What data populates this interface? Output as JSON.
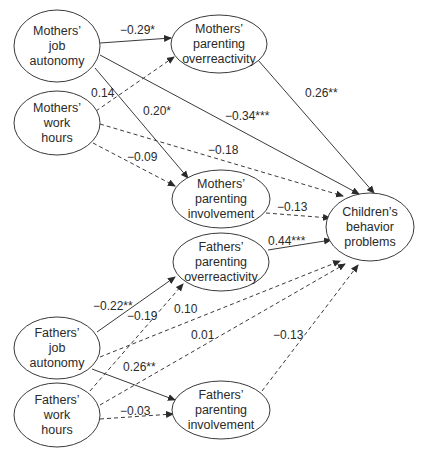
{
  "diagram": {
    "title": "",
    "line_color": "#3a3a3a",
    "text_color": "#2a2a2a",
    "nodes": [
      {
        "id": "mja",
        "lines": [
          "Mothers’",
          "job",
          "autonomy"
        ],
        "cx": 57,
        "cy": 46,
        "rx": 43,
        "ry": 36
      },
      {
        "id": "mwh",
        "lines": [
          "Mothers’",
          "work",
          "hours"
        ],
        "cx": 57,
        "cy": 123,
        "rx": 43,
        "ry": 32
      },
      {
        "id": "mpo",
        "lines": [
          "Mothers’",
          "parenting",
          "overreactivity"
        ],
        "cx": 219,
        "cy": 44,
        "rx": 48,
        "ry": 29
      },
      {
        "id": "mpi",
        "lines": [
          "Mothers’",
          "parenting",
          "involvement"
        ],
        "cx": 221,
        "cy": 199,
        "rx": 49,
        "ry": 29
      },
      {
        "id": "cbp",
        "lines": [
          "Children’s",
          "behavior",
          "problems"
        ],
        "cx": 370,
        "cy": 227,
        "rx": 44,
        "ry": 34
      },
      {
        "id": "fpo",
        "lines": [
          "Fathers’",
          "parenting",
          "overreactivity"
        ],
        "cx": 221,
        "cy": 262,
        "rx": 48,
        "ry": 29
      },
      {
        "id": "fja",
        "lines": [
          "Fathers’",
          "job",
          "autonomy"
        ],
        "cx": 57,
        "cy": 348,
        "rx": 43,
        "ry": 31
      },
      {
        "id": "fwh",
        "lines": [
          "Fathers’",
          "work",
          "hours"
        ],
        "cx": 57,
        "cy": 415,
        "rx": 43,
        "ry": 32
      },
      {
        "id": "fpi",
        "lines": [
          "Fathers’",
          "parenting",
          "involvement"
        ],
        "cx": 221,
        "cy": 410,
        "rx": 49,
        "ry": 29
      }
    ],
    "edges": [
      {
        "from": "mja",
        "to": "mpo",
        "label": "−0.29*",
        "style": "solid",
        "x1": 100,
        "y1": 43,
        "x2": 171,
        "y2": 38,
        "lx": 120,
        "ly": 34
      },
      {
        "from": "mwh",
        "to": "mpo",
        "label": "0.14",
        "style": "dashed",
        "x1": 96,
        "y1": 111,
        "x2": 174,
        "y2": 57,
        "lx": 91,
        "ly": 97
      },
      {
        "from": "mja",
        "to": "cbp",
        "label": "−0.34***",
        "style": "solid",
        "x1": 100,
        "y1": 55,
        "x2": 359,
        "y2": 194,
        "lx": 225,
        "ly": 120
      },
      {
        "from": "mja",
        "to": "mpi",
        "label": "0.20*",
        "style": "solid",
        "x1": 95,
        "y1": 68,
        "x2": 188,
        "y2": 178,
        "lx": 143,
        "ly": 115
      },
      {
        "from": "mwh",
        "to": "cbp",
        "label": "−0.18",
        "style": "dashed",
        "x1": 100,
        "y1": 124,
        "x2": 343,
        "y2": 196,
        "lx": 208,
        "ly": 154
      },
      {
        "from": "mwh",
        "to": "mpi",
        "label": "−0.09",
        "style": "dashed",
        "x1": 93,
        "y1": 143,
        "x2": 175,
        "y2": 186,
        "lx": 127,
        "ly": 161
      },
      {
        "from": "mpo",
        "to": "cbp",
        "label": "0.26**",
        "style": "solid",
        "x1": 258,
        "y1": 60,
        "x2": 374,
        "y2": 193,
        "lx": 305,
        "ly": 97
      },
      {
        "from": "mpi",
        "to": "cbp",
        "label": "−0.13",
        "style": "dashed",
        "x1": 266,
        "y1": 213,
        "x2": 330,
        "y2": 218,
        "lx": 277,
        "ly": 211
      },
      {
        "from": "fpo",
        "to": "cbp",
        "label": "0.44***",
        "style": "solid",
        "x1": 268,
        "y1": 250,
        "x2": 331,
        "y2": 240,
        "lx": 268,
        "ly": 245
      },
      {
        "from": "fja",
        "to": "fpo",
        "label": "−0.22**",
        "style": "solid",
        "x1": 97,
        "y1": 332,
        "x2": 175,
        "y2": 277,
        "lx": 93,
        "ly": 310
      },
      {
        "from": "fwh",
        "to": "fpo",
        "label": "−0.19",
        "style": "dashed",
        "x1": 90,
        "y1": 391,
        "x2": 183,
        "y2": 284,
        "lx": 127,
        "ly": 320
      },
      {
        "from": "fja",
        "to": "cbp",
        "label": "0.10",
        "style": "dashed",
        "x1": 100,
        "y1": 357,
        "x2": 340,
        "y2": 261,
        "lx": 174,
        "ly": 313
      },
      {
        "from": "fwh",
        "to": "cbp",
        "label": "0.01",
        "style": "dashed",
        "x1": 100,
        "y1": 405,
        "x2": 345,
        "y2": 264,
        "lx": 191,
        "ly": 339
      },
      {
        "from": "fja",
        "to": "fpi",
        "label": "0.26**",
        "style": "solid",
        "x1": 92,
        "y1": 369,
        "x2": 175,
        "y2": 400,
        "lx": 123,
        "ly": 371
      },
      {
        "from": "fwh",
        "to": "fpi",
        "label": "−0.03",
        "style": "dashed",
        "x1": 100,
        "y1": 419,
        "x2": 173,
        "y2": 414,
        "lx": 120,
        "ly": 415
      },
      {
        "from": "fpi",
        "to": "cbp",
        "label": "−0.13",
        "style": "dashed",
        "x1": 262,
        "y1": 391,
        "x2": 358,
        "y2": 265,
        "lx": 273,
        "ly": 339
      }
    ]
  }
}
